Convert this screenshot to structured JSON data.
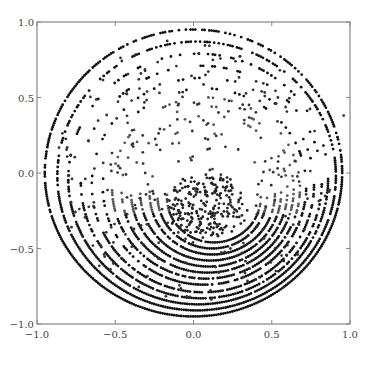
{
  "chart_data": {
    "type": "scatter",
    "title": "",
    "xlabel": "",
    "ylabel": "",
    "xlim": [
      -1.0,
      1.0
    ],
    "ylim": [
      -1.0,
      1.0
    ],
    "grid": false,
    "legend": null,
    "x_ticks": [
      "-1.0",
      "-0.5",
      "0.0",
      "0.5",
      "1.0"
    ],
    "y_ticks": [
      "1.0",
      "0.5",
      "0.0",
      "-0.5",
      "-1.0"
    ],
    "x_tick_values": [
      -1.0,
      -0.5,
      0.0,
      0.5,
      1.0
    ],
    "y_tick_values": [
      1.0,
      0.5,
      0.0,
      -0.5,
      -1.0
    ],
    "rings": [
      {
        "cx": 0.0,
        "cy": 0.0,
        "r": 0.95,
        "density": 0.85
      },
      {
        "cx": 0.02,
        "cy": -0.02,
        "r": 0.89,
        "density": 0.75
      },
      {
        "cx": 0.03,
        "cy": -0.04,
        "r": 0.83,
        "density": 0.6
      },
      {
        "cx": 0.05,
        "cy": -0.06,
        "r": 0.77,
        "density": 0.5
      },
      {
        "cx": 0.06,
        "cy": -0.08,
        "r": 0.71,
        "density": 0.45
      },
      {
        "cx": 0.07,
        "cy": -0.09,
        "r": 0.65,
        "density": 0.45
      },
      {
        "cx": 0.08,
        "cy": -0.1,
        "r": 0.6,
        "density": 0.5
      },
      {
        "cx": 0.09,
        "cy": -0.11,
        "r": 0.55,
        "density": 0.55
      },
      {
        "cx": 0.1,
        "cy": -0.12,
        "r": 0.5,
        "density": 0.55
      },
      {
        "cx": 0.11,
        "cy": -0.13,
        "r": 0.45,
        "density": 0.6
      },
      {
        "cx": 0.12,
        "cy": -0.14,
        "r": 0.4,
        "density": 0.6
      },
      {
        "cx": 0.12,
        "cy": -0.15,
        "r": 0.35,
        "density": 0.6
      },
      {
        "cx": 0.13,
        "cy": -0.16,
        "r": 0.3,
        "density": 0.55
      }
    ],
    "cluster": {
      "cx": 0.05,
      "cy": -0.22,
      "spread": 0.15,
      "count": 220
    },
    "scatter_noise_count": 260,
    "point_color": "#111111",
    "point_size": 2.2
  }
}
